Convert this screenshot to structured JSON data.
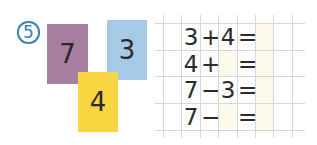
{
  "exercise": {
    "number": "5",
    "badge_color": "#3a84b5"
  },
  "cards": [
    {
      "value": "7",
      "color": "#a67f9f"
    },
    {
      "value": "3",
      "color": "#a8c8e8"
    },
    {
      "value": "4",
      "color": "#f9d640"
    }
  ],
  "equations": [
    {
      "a": "3",
      "op": "+",
      "b": "4",
      "eq": "=",
      "result": ""
    },
    {
      "a": "4",
      "op": "+",
      "b": "",
      "eq": "=",
      "result": ""
    },
    {
      "a": "7",
      "op": "−",
      "b": "3",
      "eq": "=",
      "result": ""
    },
    {
      "a": "7",
      "op": "−",
      "b": "",
      "eq": "=",
      "result": ""
    }
  ],
  "colors": {
    "grid_line": "#d8d8d8",
    "answer_fill": "#fbfaea"
  }
}
